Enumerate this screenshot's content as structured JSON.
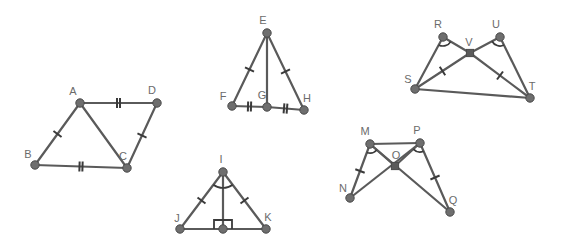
{
  "figure": {
    "background_color": "#ffffff",
    "stroke_color": "#5a5a5a",
    "vertex_color": "#6e6e6e",
    "label_color": "#6b6b6b",
    "width": 565,
    "height": 248
  },
  "shapes": [
    {
      "id": "abcd",
      "name": "quadrilateral-abcd",
      "points": {
        "A": {
          "x": 80,
          "y": 103,
          "label": "A",
          "lx": 73,
          "ly": 95
        },
        "B": {
          "x": 35,
          "y": 165,
          "label": "B",
          "lx": 28,
          "ly": 158
        },
        "C": {
          "x": 127,
          "y": 168,
          "label": "C",
          "lx": 123,
          "ly": 160
        },
        "D": {
          "x": 157,
          "y": 103,
          "label": "D",
          "lx": 152,
          "ly": 94
        }
      },
      "segments": [
        {
          "from": "A",
          "to": "D",
          "ticks": 2
        },
        {
          "from": "A",
          "to": "B",
          "ticks": 1
        },
        {
          "from": "A",
          "to": "C",
          "ticks": 0
        },
        {
          "from": "B",
          "to": "C",
          "ticks": 2
        },
        {
          "from": "C",
          "to": "D",
          "ticks": 1
        }
      ],
      "angle_marks": [],
      "right_angles": []
    },
    {
      "id": "efgh",
      "name": "triangle-pair-efgh",
      "points": {
        "E": {
          "x": 267,
          "y": 33,
          "label": "E",
          "lx": 263,
          "ly": 24
        },
        "F": {
          "x": 232,
          "y": 106,
          "label": "F",
          "lx": 223,
          "ly": 100
        },
        "G": {
          "x": 267,
          "y": 107,
          "label": "G",
          "lx": 262,
          "ly": 99
        },
        "H": {
          "x": 304,
          "y": 110,
          "label": "H",
          "lx": 307,
          "ly": 102
        }
      },
      "segments": [
        {
          "from": "E",
          "to": "F",
          "ticks": 1
        },
        {
          "from": "E",
          "to": "G",
          "ticks": 0
        },
        {
          "from": "E",
          "to": "H",
          "ticks": 1
        },
        {
          "from": "F",
          "to": "G",
          "ticks": 2
        },
        {
          "from": "G",
          "to": "H",
          "ticks": 2
        }
      ],
      "angle_marks": [],
      "right_angles": []
    },
    {
      "id": "rsuvt",
      "name": "triangle-pair-rsvut",
      "points": {
        "R": {
          "x": 443,
          "y": 37,
          "label": "R",
          "lx": 438,
          "ly": 28
        },
        "U": {
          "x": 500,
          "y": 37,
          "label": "U",
          "lx": 496,
          "ly": 28
        },
        "V": {
          "x": 470,
          "y": 53,
          "label": "V",
          "lx": 469,
          "ly": 46
        },
        "S": {
          "x": 415,
          "y": 89,
          "label": "S",
          "lx": 408,
          "ly": 83
        },
        "T": {
          "x": 530,
          "y": 98,
          "label": "T",
          "lx": 532,
          "ly": 90
        }
      },
      "segments": [
        {
          "from": "R",
          "to": "S",
          "ticks": 0
        },
        {
          "from": "R",
          "to": "V",
          "ticks": 0
        },
        {
          "from": "V",
          "to": "T",
          "ticks": 1
        },
        {
          "from": "U",
          "to": "V",
          "ticks": 0
        },
        {
          "from": "U",
          "to": "T",
          "ticks": 0
        },
        {
          "from": "S",
          "to": "V",
          "ticks": 1
        },
        {
          "from": "S",
          "to": "T",
          "ticks": 0
        }
      ],
      "angle_marks": [
        {
          "at": "R",
          "a": "S",
          "b": "V",
          "radius": 9
        },
        {
          "at": "U",
          "a": "V",
          "b": "T",
          "radius": 9
        }
      ],
      "right_angles": []
    },
    {
      "id": "ijkl",
      "name": "triangle-ijk-with-altitude",
      "points": {
        "I": {
          "x": 223,
          "y": 172,
          "label": "I",
          "lx": 221,
          "ly": 163
        },
        "J": {
          "x": 180,
          "y": 229,
          "label": "J",
          "lx": 177,
          "ly": 222
        },
        "K": {
          "x": 266,
          "y": 229,
          "label": "K",
          "lx": 268,
          "ly": 221
        },
        "L": {
          "x": 223,
          "y": 229,
          "label": "",
          "lx": 223,
          "ly": 229
        }
      },
      "segments": [
        {
          "from": "I",
          "to": "J",
          "ticks": 1
        },
        {
          "from": "I",
          "to": "K",
          "ticks": 1
        },
        {
          "from": "I",
          "to": "L",
          "ticks": 0
        },
        {
          "from": "J",
          "to": "K",
          "ticks": 0
        }
      ],
      "angle_marks": [
        {
          "at": "I",
          "a": "J",
          "b": "K",
          "radius": 16
        }
      ],
      "right_angles": [
        {
          "at": "L",
          "a": "I",
          "b": "K",
          "size": 9
        }
      ]
    },
    {
      "id": "mnopq",
      "name": "triangle-pair-mnopq",
      "points": {
        "M": {
          "x": 370,
          "y": 144,
          "label": "M",
          "lx": 365,
          "ly": 135
        },
        "P": {
          "x": 420,
          "y": 143,
          "label": "P",
          "lx": 417,
          "ly": 134
        },
        "O": {
          "x": 395,
          "y": 166,
          "label": "O",
          "lx": 396,
          "ly": 159
        },
        "N": {
          "x": 350,
          "y": 198,
          "label": "N",
          "lx": 343,
          "ly": 192
        },
        "Q": {
          "x": 450,
          "y": 212,
          "label": "Q",
          "lx": 453,
          "ly": 204
        }
      },
      "segments": [
        {
          "from": "M",
          "to": "P",
          "ticks": 0
        },
        {
          "from": "M",
          "to": "N",
          "ticks": 1
        },
        {
          "from": "M",
          "to": "O",
          "ticks": 0
        },
        {
          "from": "M",
          "to": "Q",
          "ticks": 0
        },
        {
          "from": "P",
          "to": "Q",
          "ticks": 1
        },
        {
          "from": "P",
          "to": "O",
          "ticks": 0
        },
        {
          "from": "P",
          "to": "N",
          "ticks": 0
        }
      ],
      "angle_marks": [
        {
          "at": "M",
          "a": "N",
          "b": "O",
          "radius": 9
        },
        {
          "at": "P",
          "a": "O",
          "b": "Q",
          "radius": 9
        }
      ],
      "right_angles": []
    }
  ]
}
